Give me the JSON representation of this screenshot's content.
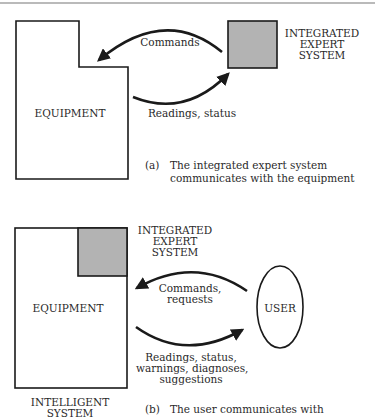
{
  "colors": {
    "line": "#1a1a1a",
    "expert_system_fill": "#b3b3b3",
    "text": "#2a2a2a",
    "background": "#ffffff"
  },
  "diagram_a": {
    "equipment_label": "EQUIPMENT",
    "expert_system_label": [
      "INTEGRATED",
      "EXPERT",
      "SYSTEM"
    ],
    "arrow_top_label": "Commands",
    "arrow_bottom_label": "Readings, status",
    "caption_marker": "(a)",
    "caption_lines": [
      "The integrated expert system",
      "communicates with the equipment"
    ]
  },
  "diagram_b": {
    "equipment_label": "EQUIPMENT",
    "expert_system_label": [
      "INTEGRATED",
      "EXPERT",
      "SYSTEM"
    ],
    "user_label": "USER",
    "arrow_top_label": [
      "Commands,",
      "requests"
    ],
    "arrow_bottom_label": [
      "Readings, status,",
      "warnings, diagnoses,",
      "suggestions"
    ],
    "system_label": [
      "INTELLIGENT",
      "SYSTEM"
    ],
    "caption_marker": "(b)",
    "caption_lines": [
      "The user communicates with"
    ]
  }
}
